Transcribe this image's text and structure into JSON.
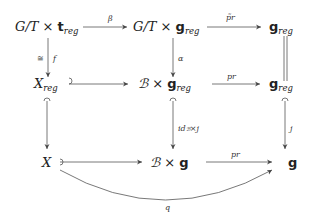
{
  "diagram": {
    "type": "commutative-diagram",
    "nodes": {
      "n11": {
        "main": "G/T × ",
        "frak": "t",
        "sub": "reg"
      },
      "n12": {
        "main": "G/T × ",
        "frak": "g",
        "sub": "reg"
      },
      "n13": {
        "frak": "g",
        "sub": "reg"
      },
      "n21": {
        "main": "X",
        "sub": "reg"
      },
      "n22": {
        "script": "ℬ",
        "main": " × ",
        "frak": "g",
        "sub": "reg"
      },
      "n23": {
        "frak": "g",
        "sub": "reg"
      },
      "n31": {
        "main": "X"
      },
      "n32": {
        "script": "ℬ",
        "main": " × ",
        "frak": "g"
      },
      "n33": {
        "frak": "g"
      }
    },
    "arrows": {
      "beta": {
        "from": "n11",
        "to": "n12",
        "label": "β",
        "style": "arrow"
      },
      "prtilde": {
        "from": "n12",
        "to": "n13",
        "label": "p̃r",
        "style": "arrow"
      },
      "f": {
        "from": "n11",
        "to": "n21",
        "label": "f",
        "label_left": "≅",
        "style": "arrow"
      },
      "alpha": {
        "from": "n12",
        "to": "n22",
        "label": "α",
        "style": "arrow"
      },
      "eq": {
        "from": "n13",
        "to": "n23",
        "label": "",
        "style": "double-line"
      },
      "inc1": {
        "from": "n21",
        "to": "n22",
        "label": "",
        "style": "hook"
      },
      "pr1": {
        "from": "n22",
        "to": "n23",
        "label": "pr",
        "style": "arrow"
      },
      "inc2": {
        "from": "n21",
        "to": "n31",
        "label": "",
        "style": "hook"
      },
      "idj": {
        "from": "n22",
        "to": "n32",
        "label": "id_ℬ×j",
        "style": "hook"
      },
      "j": {
        "from": "n23",
        "to": "n33",
        "label": "j",
        "style": "hook"
      },
      "inc3": {
        "from": "n31",
        "to": "n32",
        "label": "",
        "style": "hook"
      },
      "pr2": {
        "from": "n32",
        "to": "n33",
        "label": "pr",
        "style": "arrow"
      },
      "q": {
        "from": "n31",
        "to": "n33",
        "label": "q",
        "style": "curved"
      }
    },
    "labels": {
      "beta": "β",
      "prtilde": "p̃r",
      "f": "f",
      "iso": "≅",
      "alpha": "α",
      "pr1": "pr",
      "idj_main": "id",
      "idj_sub": "ℬ",
      "idj_rest": "×j",
      "j": "j",
      "pr2": "pr",
      "q": "q"
    },
    "text": {
      "GT": "G/T × ",
      "t": "t",
      "g": "g",
      "reg": "reg",
      "X": "X",
      "B": "ℬ",
      "times": " × "
    }
  }
}
